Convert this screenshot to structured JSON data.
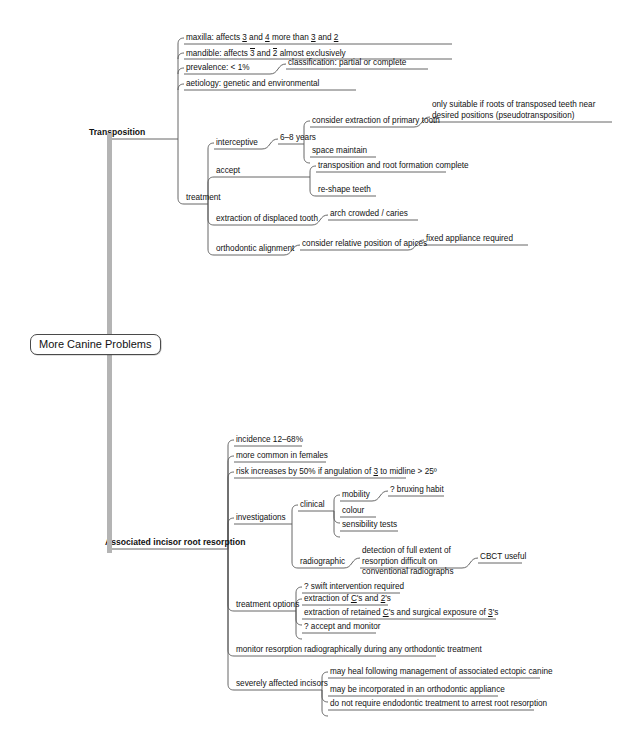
{
  "title": "More Canine Problems",
  "root": {
    "label": "More Canine Problems"
  },
  "colors": {
    "trunk": "#b4b4b4",
    "line": "#555555",
    "text": "#111111",
    "background": "#ffffff"
  },
  "branches": [
    {
      "id": "transposition",
      "label": "Transposition",
      "children": [
        {
          "id": "maxilla",
          "label": "maxilla: affects 3 and 4 more than 3 and 2"
        },
        {
          "id": "mandible",
          "label": "mandible: affects 3 and 2 almost exclusively"
        },
        {
          "id": "prevalence",
          "label": "prevalence: < 1%",
          "children": [
            {
              "id": "classification",
              "label": "classification: partial or complete"
            }
          ]
        },
        {
          "id": "aetiology",
          "label": "aetiology: genetic and environmental"
        },
        {
          "id": "treatment",
          "label": "treatment",
          "children": [
            {
              "id": "interceptive",
              "label": "interceptive",
              "children": [
                {
                  "id": "six-eight-years",
                  "label": "6–8 years",
                  "children": [
                    {
                      "id": "consider-extraction-primary",
                      "label": "consider extraction of primary tooth",
                      "children": [
                        {
                          "id": "pseudotransposition",
                          "label": "only suitable if roots of transposed teeth near desired positions (pseudotransposition)"
                        }
                      ]
                    },
                    {
                      "id": "space-maintain",
                      "label": "space maintain"
                    }
                  ]
                }
              ]
            },
            {
              "id": "accept",
              "label": "accept",
              "children": [
                {
                  "id": "transposition-root-formation",
                  "label": "transposition and root formation complete"
                },
                {
                  "id": "re-shape-teeth",
                  "label": "re-shape teeth"
                }
              ]
            },
            {
              "id": "extraction-displaced",
              "label": "extraction of displaced tooth",
              "children": [
                {
                  "id": "arch-crowded-caries",
                  "label": "arch crowded / caries"
                }
              ]
            },
            {
              "id": "orthodontic-alignment",
              "label": "orthodontic alignment",
              "children": [
                {
                  "id": "relative-position-apices",
                  "label": "consider relative position of apices",
                  "children": [
                    {
                      "id": "fixed-appliance-required",
                      "label": "fixed appliance required"
                    }
                  ]
                }
              ]
            }
          ]
        }
      ]
    },
    {
      "id": "root-resorption",
      "label": "Associated incisor root resorption",
      "children": [
        {
          "id": "incidence",
          "label": "incidence 12–68%"
        },
        {
          "id": "more-common-females",
          "label": "more common in females"
        },
        {
          "id": "risk-angulation",
          "label": "risk increases by 50% if angulation of 3 to midline > 25º"
        },
        {
          "id": "investigations",
          "label": "investigations",
          "children": [
            {
              "id": "clinical",
              "label": "clinical",
              "children": [
                {
                  "id": "mobility",
                  "label": "mobility",
                  "children": [
                    {
                      "id": "bruxing-habit",
                      "label": "? bruxing habit"
                    }
                  ]
                },
                {
                  "id": "colour",
                  "label": "colour"
                },
                {
                  "id": "sensibility-tests",
                  "label": "sensibility tests"
                }
              ]
            },
            {
              "id": "radiographic",
              "label": "radiographic",
              "children": [
                {
                  "id": "detection-difficult",
                  "label": "detection of full extent of resorption difficult on conventional radiographs",
                  "children": [
                    {
                      "id": "cbct-useful",
                      "label": "CBCT useful"
                    }
                  ]
                }
              ]
            }
          ]
        },
        {
          "id": "treatment-options",
          "label": "treatment options",
          "children": [
            {
              "id": "swift-intervention",
              "label": "? swift intervention required"
            },
            {
              "id": "extraction-cs-2s",
              "label": "extraction of C's and 2's"
            },
            {
              "id": "extraction-retained-cs",
              "label": "extraction of retained C's and surgical exposure of 3's"
            },
            {
              "id": "accept-and-monitor",
              "label": "? accept and monitor"
            }
          ]
        },
        {
          "id": "monitor-resorption",
          "label": "monitor resorption radiographically during any orthodontic treatment"
        },
        {
          "id": "severely-affected",
          "label": "severely affected incisors",
          "children": [
            {
              "id": "may-heal",
              "label": "may heal following management of associated ectopic canine"
            },
            {
              "id": "may-be-incorporated",
              "label": "may be incorporated in an orthodontic appliance"
            },
            {
              "id": "no-endodontic",
              "label": "do not require endodontic treatment to arrest root resorption"
            }
          ]
        }
      ]
    }
  ]
}
